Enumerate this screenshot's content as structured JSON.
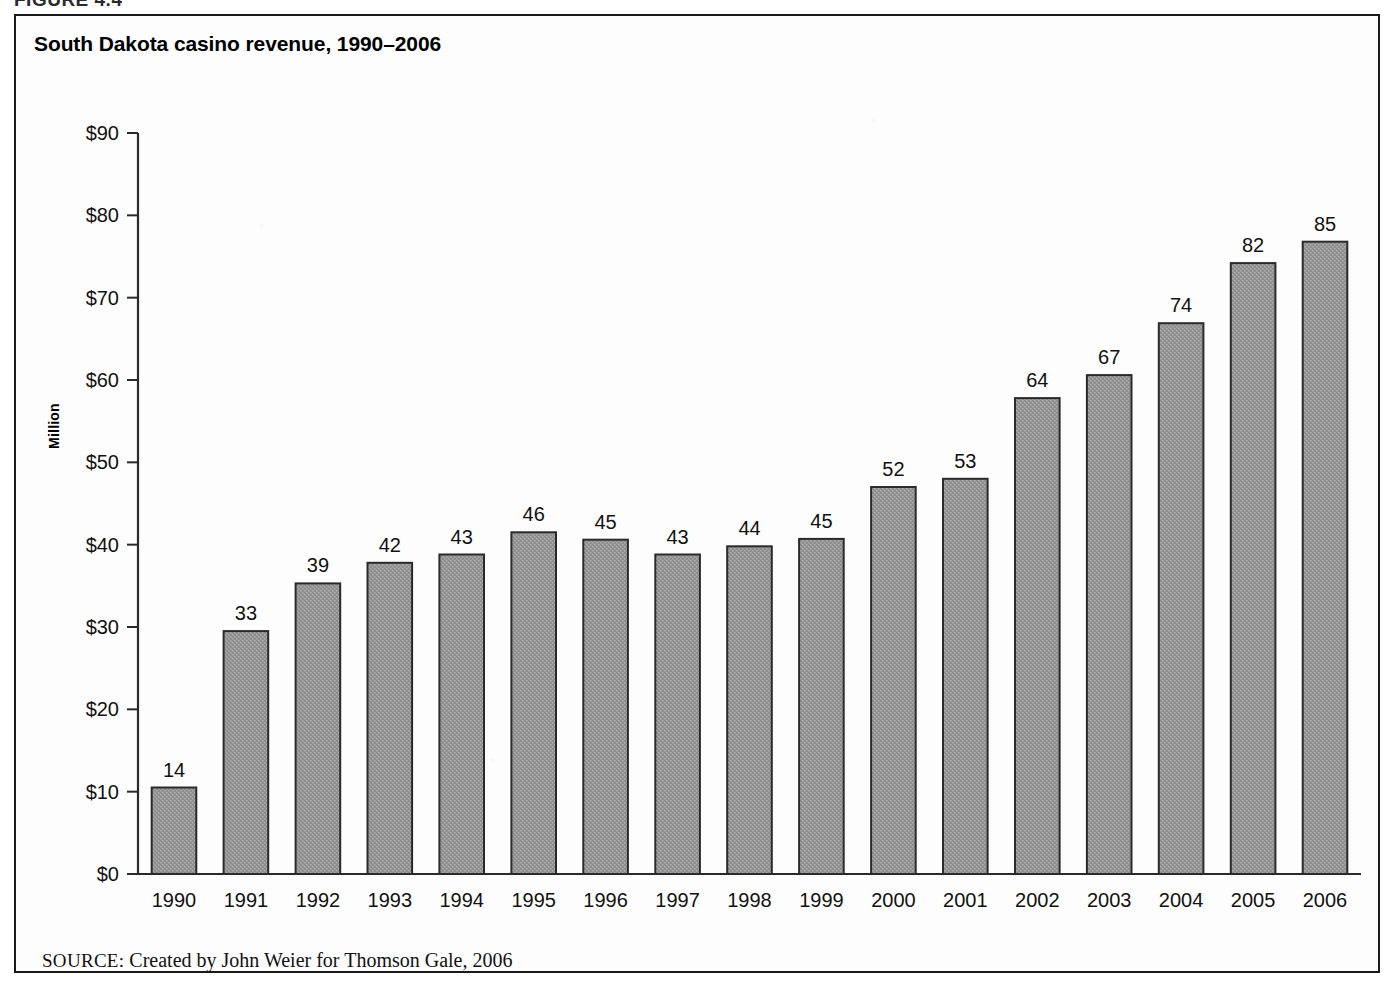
{
  "figure": {
    "caption": "FIGURE 4.4",
    "frame_color": "#1a1a1a"
  },
  "chart_title": "South Dakota casino revenue, 1990–2006",
  "source": {
    "label": "SOURCE:",
    "text": " Created by John Weier for Thomson Gale, 2006"
  },
  "colors": {
    "bar_fill": "#9a9a9a",
    "bar_stroke": "#2a2a2a",
    "axis": "#2a2a2a",
    "text": "#111111",
    "background": "#fdfdfd"
  },
  "chart_data": {
    "type": "bar",
    "title": "South Dakota casino revenue, 1990–2006",
    "xlabel": "",
    "ylabel": "Million",
    "ylim": [
      0,
      90
    ],
    "yticks": [
      0,
      10,
      20,
      30,
      40,
      50,
      60,
      70,
      80,
      90
    ],
    "ytick_labels": [
      "$0",
      "$10",
      "$20",
      "$30",
      "$40",
      "$50",
      "$60",
      "$70",
      "$80",
      "$90"
    ],
    "grid": false,
    "legend": "none",
    "value_labels_shown": true,
    "categories": [
      "1990",
      "1991",
      "1992",
      "1993",
      "1994",
      "1995",
      "1996",
      "1997",
      "1998",
      "1999",
      "2000",
      "2001",
      "2002",
      "2003",
      "2004",
      "2005",
      "2006"
    ],
    "values": [
      14,
      33,
      39,
      42,
      43,
      46,
      45,
      43,
      44,
      45,
      52,
      53,
      64,
      67,
      74,
      82,
      85
    ],
    "plotted_heights": [
      10.5,
      29.5,
      35.3,
      37.8,
      38.8,
      41.5,
      40.6,
      38.8,
      39.8,
      40.7,
      47.0,
      48.0,
      57.8,
      60.6,
      66.9,
      74.2,
      76.8
    ],
    "labels": [
      "14",
      "33",
      "39",
      "42",
      "43",
      "46",
      "45",
      "43",
      "44",
      "45",
      "52",
      "53",
      "64",
      "67",
      "74",
      "82",
      "85"
    ]
  }
}
